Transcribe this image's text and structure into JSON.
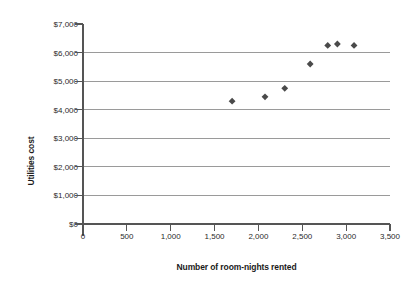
{
  "chart_data": {
    "type": "scatter",
    "title": "",
    "xlabel": "Number of room-nights rented",
    "ylabel": "Utilities cost",
    "xlim": [
      0,
      3500
    ],
    "ylim": [
      0,
      7000
    ],
    "grid": true,
    "legend": null,
    "x_tick_labels": [
      "0",
      "500",
      "1,000",
      "1,500",
      "2,000",
      "2,500",
      "3,000",
      "3,500"
    ],
    "x_tick_values": [
      0,
      500,
      1000,
      1500,
      2000,
      2500,
      3000,
      3500
    ],
    "y_tick_labels": [
      "$0",
      "$1,000",
      "$2,000",
      "$3,000",
      "$4,000",
      "$5,000",
      "$6,000",
      "$7,000"
    ],
    "y_tick_values": [
      0,
      1000,
      2000,
      3000,
      4000,
      5000,
      6000,
      7000
    ],
    "gridline_values": [
      1000,
      2000,
      3000,
      4000,
      5000,
      6000
    ],
    "marker": "diamond",
    "marker_color": "#4a4a4a",
    "gridline_color": "#9a9a9a",
    "axis_color": "#555555",
    "points": [
      {
        "x": 1700,
        "y": 4300
      },
      {
        "x": 2075,
        "y": 4450
      },
      {
        "x": 2300,
        "y": 4750
      },
      {
        "x": 2590,
        "y": 5600
      },
      {
        "x": 2790,
        "y": 6250
      },
      {
        "x": 2900,
        "y": 6300
      },
      {
        "x": 3090,
        "y": 6250
      }
    ]
  }
}
